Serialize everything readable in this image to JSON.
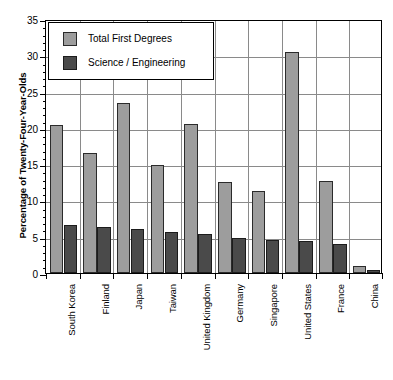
{
  "chart_data": {
    "type": "bar",
    "title": "",
    "subtitle": "",
    "xlabel": "",
    "ylabel": "Percentage of Twenty-Four-Year-Olds",
    "ylim": [
      0,
      35
    ],
    "ytick_labels": [
      "0",
      "5",
      "10",
      "15",
      "20",
      "25",
      "30",
      "35"
    ],
    "ytick_values": [
      0,
      5,
      10,
      15,
      20,
      25,
      30,
      35
    ],
    "minor_tick_step": 1,
    "grid": "both",
    "legend_position": "upper-left-inside",
    "categories": [
      "South Korea",
      "Finland",
      "Japan",
      "Taiwan",
      "United Kingdom",
      "Germany",
      "Singapore",
      "United States",
      "France",
      "China"
    ],
    "series": [
      {
        "name": "Total First Degrees",
        "color": "#9d9d9d",
        "values": [
          20.4,
          16.6,
          23.4,
          14.9,
          20.6,
          12.6,
          11.3,
          30.4,
          12.7,
          0.9
        ]
      },
      {
        "name": "Science / Engineering",
        "color": "#4a4a4a",
        "values": [
          6.6,
          6.3,
          6.1,
          5.7,
          5.4,
          4.8,
          4.6,
          4.4,
          4.0,
          0.4
        ]
      }
    ]
  },
  "legend": {
    "items": [
      {
        "label": "Total First Degrees",
        "color": "#9d9d9d"
      },
      {
        "label": "Science / Engineering",
        "color": "#4a4a4a"
      }
    ]
  },
  "axis": {
    "y_title": "Percentage of Twenty-Four-Year-Olds"
  },
  "colors": {
    "total_first_degrees": "#9d9d9d",
    "science_engineering": "#4a4a4a",
    "grid": "#8a8a8a",
    "axis": "#000000",
    "background": "#ffffff"
  }
}
